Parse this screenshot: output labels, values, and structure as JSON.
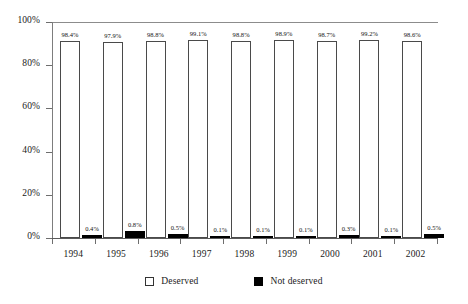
{
  "chart_data": {
    "type": "bar",
    "title": "",
    "subtitle": "",
    "xlabel": "",
    "ylabel": "",
    "ylim": [
      0,
      100
    ],
    "y_ticks": [
      "0%",
      "20%",
      "40%",
      "60%",
      "80%",
      "100%"
    ],
    "y_tick_values": [
      0,
      20,
      40,
      60,
      80,
      100
    ],
    "grid": false,
    "legend_position": "bottom",
    "categories": [
      "1994",
      "1995",
      "1996",
      "1997",
      "1998",
      "1999",
      "2000",
      "2001",
      "2002"
    ],
    "series": [
      {
        "name": "Deserved",
        "color": "#ffffff",
        "values": [
          98.4,
          97.9,
          98.8,
          99.1,
          98.8,
          98.9,
          98.7,
          99.2,
          98.6
        ],
        "labels": [
          "98.4%",
          "97.9%",
          "98.8%",
          "99.1%",
          "98.8%",
          "98.9%",
          "98.7%",
          "99.2%",
          "98.6%"
        ]
      },
      {
        "name": "Not deserved",
        "color": "#000000",
        "values": [
          0.4,
          0.8,
          0.5,
          0.1,
          0.1,
          0.1,
          0.3,
          0.1,
          0.5
        ],
        "labels": [
          "0.4%",
          "0.8%",
          "0.5%",
          "0.1%",
          "0.1%",
          "0.1%",
          "0.3%",
          "0.1%",
          "0.5%"
        ]
      }
    ]
  },
  "legend": {
    "items": [
      {
        "label": "Deserved",
        "swatch": "white-square-outline"
      },
      {
        "label": "Not deserved",
        "swatch": "black-square-filled"
      }
    ]
  }
}
